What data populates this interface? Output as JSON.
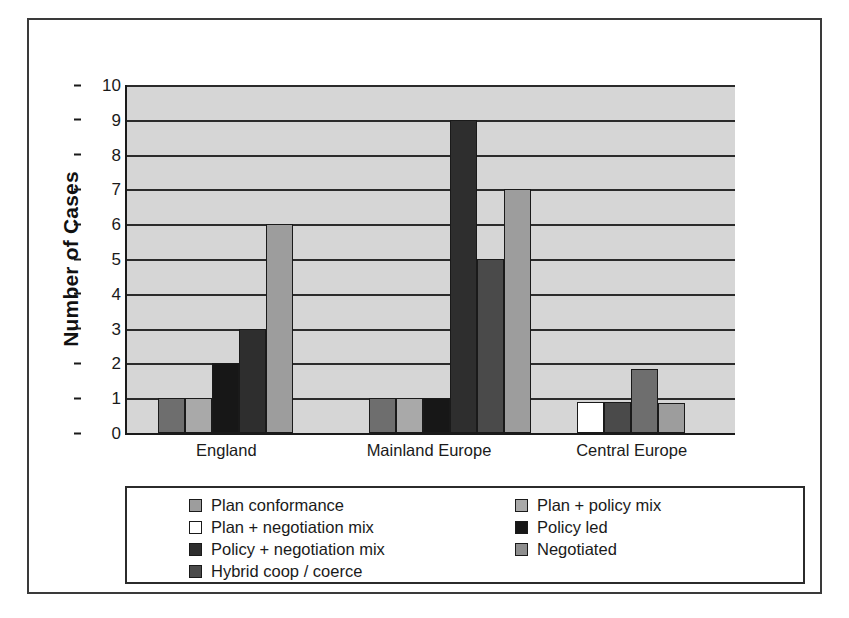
{
  "chart_data": {
    "type": "bar",
    "title": "",
    "xlabel": "",
    "ylabel": "Number of Cases",
    "ylim": [
      0,
      10
    ],
    "ytick_labels": [
      "0",
      "1",
      "2",
      "3",
      "4",
      "5",
      "6",
      "7",
      "8",
      "9",
      "10"
    ],
    "grid": true,
    "legend_position": "bottom",
    "categories": [
      "England",
      "Mainland Europe",
      "Central Europe"
    ],
    "series": [
      {
        "name": "Plan conformance",
        "color": "#6e6e6e",
        "values": [
          1,
          1,
          0
        ]
      },
      {
        "name": "Plan + policy mix",
        "color": "#a9a9a9",
        "values": [
          1,
          1,
          0
        ]
      },
      {
        "name": "Plan + negotiation mix",
        "color": "#ffffff",
        "values": [
          0,
          0,
          0.9
        ]
      },
      {
        "name": "Policy led",
        "color": "#171717",
        "values": [
          2,
          1,
          0.9
        ]
      },
      {
        "name": "Policy + negotiation mix",
        "color": "#2e2e2e",
        "values": [
          3,
          9,
          1.85
        ]
      },
      {
        "name": "Hybrid coop / coerce",
        "color": "#4a4a4a",
        "values": [
          0,
          5,
          0
        ]
      },
      {
        "name": "Negotiated",
        "color": "#9d9d9d",
        "values": [
          6,
          7,
          0.85
        ]
      }
    ],
    "legend_columns": [
      [
        "Plan conformance",
        "Plan + negotiation mix",
        "Policy + negotiation mix",
        "Hybrid coop / coerce"
      ],
      [
        "Plan + policy mix",
        "Policy led",
        "Negotiated"
      ]
    ],
    "legend_swatch_colors": [
      [
        "#9d9d9d",
        "#ffffff",
        "#2e2e2e",
        "#4a4a4a"
      ],
      [
        "#a9a9a9",
        "#171717",
        "#8e8e8e"
      ]
    ],
    "plot_background": "#d6d6d6",
    "gridline_color": "#2b2b2b",
    "axis_color": "#1a1a1a",
    "bars": [
      {
        "category": "England",
        "series": "Plan conformance",
        "value": 1,
        "color": "#6e6e6e"
      },
      {
        "category": "England",
        "series": "Plan + policy mix",
        "value": 1,
        "color": "#a9a9a9"
      },
      {
        "category": "England",
        "series": "Policy led",
        "value": 2,
        "color": "#171717"
      },
      {
        "category": "England",
        "series": "Policy + negotiation mix",
        "value": 3,
        "color": "#2e2e2e"
      },
      {
        "category": "England",
        "series": "Negotiated",
        "value": 6,
        "color": "#9d9d9d"
      },
      {
        "category": "Mainland Europe",
        "series": "Plan conformance",
        "value": 1,
        "color": "#6e6e6e"
      },
      {
        "category": "Mainland Europe",
        "series": "Plan + policy mix",
        "value": 1,
        "color": "#a9a9a9"
      },
      {
        "category": "Mainland Europe",
        "series": "Policy led",
        "value": 1,
        "color": "#171717"
      },
      {
        "category": "Mainland Europe",
        "series": "Policy + negotiation mix",
        "value": 9,
        "color": "#2e2e2e"
      },
      {
        "category": "Mainland Europe",
        "series": "Hybrid coop / coerce",
        "value": 5,
        "color": "#4a4a4a"
      },
      {
        "category": "Mainland Europe",
        "series": "Negotiated",
        "value": 7,
        "color": "#9d9d9d"
      },
      {
        "category": "Central Europe",
        "series": "Plan + negotiation mix",
        "value": 0.9,
        "color": "#ffffff"
      },
      {
        "category": "Central Europe",
        "series": "Policy led",
        "value": 0.9,
        "color": "#4a4a4a"
      },
      {
        "category": "Central Europe",
        "series": "Policy + negotiation mix",
        "value": 1.85,
        "color": "#6e6e6e"
      },
      {
        "category": "Central Europe",
        "series": "Negotiated",
        "value": 0.85,
        "color": "#9d9d9d"
      }
    ]
  }
}
